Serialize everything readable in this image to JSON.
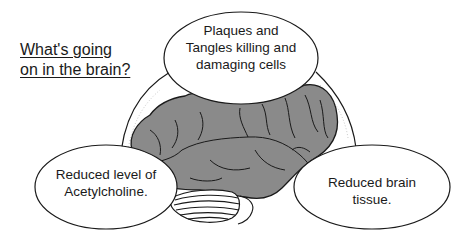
{
  "title": {
    "lines": [
      "What's going",
      "on in the brain?"
    ]
  },
  "callouts": [
    {
      "id": "plaques",
      "lines": [
        "Plaques and",
        "Tangles killing and",
        "damaging cells"
      ]
    },
    {
      "id": "acetylcholine",
      "lines": [
        "Reduced level of",
        "Acetylcholine."
      ]
    },
    {
      "id": "brain-tissue",
      "lines": [
        "Reduced brain",
        "tissue."
      ]
    }
  ],
  "illustration": {
    "subject": "brain",
    "brain_color": "#8a8a8a",
    "outline_color": "#1a1a1a"
  }
}
